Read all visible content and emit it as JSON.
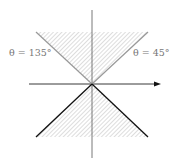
{
  "diagram": {
    "labels": {
      "left": "θ = 135°",
      "right": "θ = 45°"
    },
    "colors": {
      "axis": "#555555",
      "upper_boundary": "#999999",
      "lower_boundary": "#111111",
      "hatch": "#aaaaaa"
    },
    "regions": [
      {
        "name": "upper-cone",
        "angles_deg": [
          45,
          135
        ],
        "boundary_style": "gray"
      },
      {
        "name": "lower-cone",
        "angles_deg": [
          225,
          315
        ],
        "boundary_style": "black"
      }
    ]
  }
}
